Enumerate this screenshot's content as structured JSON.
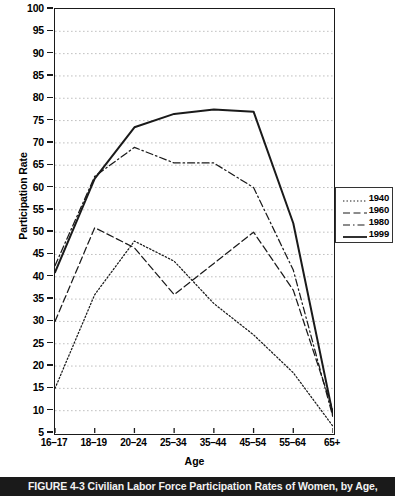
{
  "chart_data": {
    "type": "line",
    "title": "",
    "xlabel": "Age",
    "ylabel": "Participation Rate",
    "categories": [
      "16–17",
      "18–19",
      "20–24",
      "25–34",
      "35–44",
      "45–54",
      "55–64",
      "65+"
    ],
    "ylim": [
      5,
      100
    ],
    "ytick_step": 5,
    "yticks": [
      100,
      95,
      90,
      85,
      80,
      75,
      70,
      65,
      60,
      55,
      50,
      45,
      40,
      35,
      30,
      25,
      20,
      15,
      10,
      5
    ],
    "grid": true,
    "legend_position": "right",
    "series": [
      {
        "name": "1940",
        "style": "dotted",
        "values": [
          15.0,
          36.0,
          48.0,
          43.5,
          34.0,
          27.0,
          18.5,
          6.5
        ]
      },
      {
        "name": "1960",
        "style": "dashed",
        "values": [
          30.0,
          51.0,
          46.5,
          36.0,
          43.0,
          50.0,
          37.0,
          10.0
        ]
      },
      {
        "name": "1980",
        "style": "dashdot",
        "values": [
          42.5,
          62.5,
          69.0,
          65.5,
          65.5,
          60.0,
          41.5,
          8.5
        ]
      },
      {
        "name": "1999",
        "style": "solid",
        "values": [
          41.0,
          62.0,
          73.5,
          76.5,
          77.5,
          77.0,
          52.0,
          9.0
        ]
      }
    ]
  },
  "legend": {
    "entries": [
      {
        "label": "1940"
      },
      {
        "label": "1960"
      },
      {
        "label": "1980"
      },
      {
        "label": "1999"
      }
    ]
  },
  "caption": {
    "text": "FIGURE 4-3   Civilian Labor Force Participation Rates of Women, by Age,"
  }
}
